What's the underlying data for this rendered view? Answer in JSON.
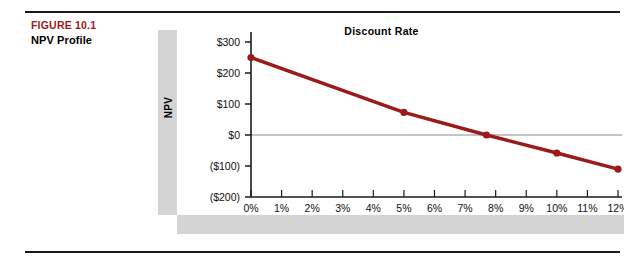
{
  "caption": {
    "figure_number": "FIGURE 10.1",
    "figure_title": "NPV Profile"
  },
  "chart_data": {
    "type": "line",
    "title": "NPV Profile",
    "xlabel": "Discount Rate",
    "ylabel": "NPV",
    "x": [
      0,
      5,
      7.7,
      10,
      12
    ],
    "values": [
      250,
      73,
      0,
      -58,
      -110
    ],
    "categories": [
      "0%",
      "5%",
      "7.7%",
      "10%",
      "12%"
    ],
    "series": [
      {
        "name": "NPV",
        "color": "#9B1B1B",
        "points": [
          {
            "x": 0,
            "y": 250
          },
          {
            "x": 5,
            "y": 73
          },
          {
            "x": 7.7,
            "y": 0
          },
          {
            "x": 10,
            "y": -58
          },
          {
            "x": 12,
            "y": -110
          }
        ]
      }
    ],
    "xtick_labels": [
      "0%",
      "1%",
      "2%",
      "3%",
      "4%",
      "5%",
      "6%",
      "7%",
      "8%",
      "9%",
      "10%",
      "11%",
      "12%"
    ],
    "xtick_values": [
      0,
      1,
      2,
      3,
      4,
      5,
      6,
      7,
      8,
      9,
      10,
      11,
      12
    ],
    "ytick_labels": [
      "$300",
      "$200",
      "$100",
      "$0",
      "($100)",
      "($200)"
    ],
    "ytick_values": [
      300,
      200,
      100,
      0,
      -100,
      -200
    ],
    "xlim": [
      0,
      12
    ],
    "ylim": [
      -200,
      300
    ],
    "grid": false,
    "zero_line": true,
    "legend": "none",
    "marker": "circle",
    "line_color": "#9B1B1B",
    "axis_color": "#1a1a1a",
    "zero_line_color": "#8a8a8a",
    "panel_color": "#d4d4d4"
  }
}
